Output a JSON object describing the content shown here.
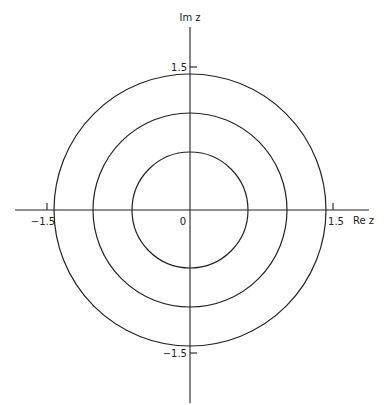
{
  "diagram": {
    "axes": {
      "x_label": "Re z",
      "y_label": "Im z",
      "origin_label": "0",
      "ticks": {
        "x_pos": "1.5",
        "x_neg": "−1.5",
        "y_pos": "1.5",
        "y_neg": "−1.5"
      }
    },
    "circles": [
      {
        "name": "inner",
        "radius_units": 0.6
      },
      {
        "name": "middle",
        "radius_units": 1.0
      },
      {
        "name": "outer",
        "radius_units": 1.4
      }
    ],
    "colors": {
      "ink": "#222222",
      "background": "#ffffff"
    }
  }
}
